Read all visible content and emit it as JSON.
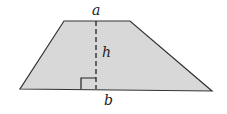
{
  "diagram": {
    "type": "trapezoid",
    "labels": {
      "top_base": "a",
      "height": "h",
      "bottom_base": "b"
    },
    "colors": {
      "fill": "#d8d8d8",
      "stroke": "#333333"
    }
  }
}
